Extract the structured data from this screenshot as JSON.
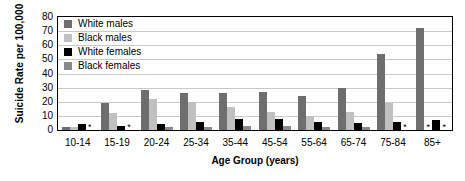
{
  "chart_data": {
    "type": "bar",
    "title": "",
    "xlabel": "Age Group (years)",
    "ylabel": "Suicide Rate per 100,000",
    "ylim": [
      0,
      80
    ],
    "yticks": [
      80,
      70,
      60,
      50,
      40,
      30,
      20,
      10,
      0
    ],
    "grid": true,
    "legend_position": "top-left-inside",
    "missing_marker": "*",
    "missing_note": "Asterisk denotes rate not shown (suppressed / unreliable)",
    "categories": [
      "10-14",
      "15-19",
      "20-24",
      "25-34",
      "35-44",
      "45-54",
      "55-64",
      "65-74",
      "75-84",
      "85+"
    ],
    "series": [
      {
        "name": "White males",
        "color": "#6e6e6e",
        "values": [
          2,
          19,
          28,
          26,
          26,
          27,
          24,
          30,
          54,
          72
        ]
      },
      {
        "name": "Black males",
        "color": "#c0c0c0",
        "values": [
          2,
          12,
          22,
          20,
          16,
          13,
          10,
          13,
          19,
          null
        ]
      },
      {
        "name": "White females",
        "color": "#000000",
        "values": [
          4,
          3,
          4,
          6,
          8,
          8,
          6,
          5,
          6,
          7
        ]
      },
      {
        "name": "Black females",
        "color": "#8a8a8a",
        "values": [
          null,
          null,
          2,
          2,
          3,
          3,
          2,
          2,
          null,
          null
        ]
      }
    ]
  },
  "legend": {
    "items": [
      {
        "label": "White males",
        "color": "#6e6e6e"
      },
      {
        "label": "Black males",
        "color": "#c0c0c0"
      },
      {
        "label": "White females",
        "color": "#000000"
      },
      {
        "label": "Black females",
        "color": "#8a8a8a"
      }
    ]
  }
}
